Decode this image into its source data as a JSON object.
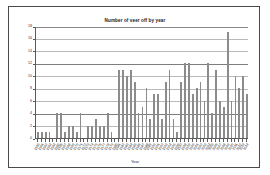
{
  "chart_data": {
    "type": "bar",
    "title": "Number of veer off by year",
    "xlabel": "Year",
    "ylabel": "",
    "ylim": [
      0,
      18
    ],
    "ytick_step": 2,
    "yticks": [
      0,
      2,
      4,
      6,
      8,
      10,
      12,
      14,
      16,
      18
    ],
    "grid": true,
    "legend": false,
    "bar_color": "#8c8c8c",
    "categories": [
      "1960",
      "1961",
      "1962",
      "1963",
      "1964",
      "1965",
      "1966",
      "1967",
      "1968",
      "1969",
      "1970",
      "1971",
      "1972",
      "1973",
      "1974",
      "1975",
      "1976",
      "1977",
      "1978",
      "1979",
      "1980",
      "1981",
      "1982",
      "1983",
      "1984",
      "1985",
      "1986",
      "1987",
      "1988",
      "1989",
      "1990",
      "1991",
      "1992",
      "1993",
      "1994",
      "1995",
      "1996",
      "1997",
      "1998",
      "1999",
      "2000",
      "2001",
      "2002",
      "2003",
      "2004",
      "2005",
      "2006",
      "2007",
      "2008",
      "2009",
      "2010",
      "2011",
      "2012",
      "2013",
      "2014"
    ],
    "values": [
      1,
      1,
      1,
      1,
      0,
      4,
      4,
      1,
      2,
      2,
      1,
      4,
      0,
      2,
      2,
      3,
      2,
      2,
      4,
      1,
      0,
      11,
      11,
      10,
      11,
      9,
      4,
      5,
      8,
      3,
      7,
      7,
      3,
      9,
      11,
      3,
      1,
      9,
      12,
      12,
      7,
      8,
      9,
      6,
      12,
      4,
      11,
      6,
      5,
      17,
      6,
      10,
      8,
      10,
      7
    ]
  }
}
